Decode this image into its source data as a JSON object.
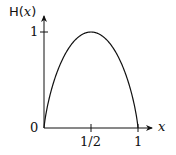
{
  "chart_data": {
    "type": "line",
    "title": "",
    "xlabel": "x",
    "ylabel": "H(x)",
    "function": "binary entropy H(x) = -x log2 x - (1-x) log2 (1-x)",
    "x": [
      0,
      0.05,
      0.1,
      0.2,
      0.3,
      0.4,
      0.5,
      0.6,
      0.7,
      0.8,
      0.9,
      0.95,
      1
    ],
    "series": [
      {
        "name": "H(x)",
        "values": [
          0,
          0.286,
          0.469,
          0.722,
          0.881,
          0.971,
          1,
          0.971,
          0.881,
          0.722,
          0.469,
          0.286,
          0
        ]
      }
    ],
    "x_ticks": [
      "0",
      "1/2",
      "1"
    ],
    "y_ticks": [
      "0",
      "1"
    ],
    "xlim": [
      0,
      1
    ],
    "ylim": [
      0,
      1
    ],
    "grid": false,
    "legend": "none"
  },
  "labels": {
    "y_axis": "H(",
    "y_axis_var": "x",
    "y_axis_close": ")",
    "x_axis": "x",
    "origin": "0",
    "y_one": "1",
    "x_half": "1/2",
    "x_one": "1"
  }
}
